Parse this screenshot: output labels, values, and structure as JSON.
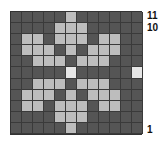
{
  "chart_data": {
    "type": "heatmap",
    "title": "",
    "columns": 12,
    "rows": 11,
    "colors": {
      "0": "#555555",
      "1": "#bdbdbd",
      "2": "#e6e6e6"
    },
    "grid_line_color": "#333333",
    "row_labels_visible": [
      {
        "row": 11,
        "label": "11"
      },
      {
        "row": 10,
        "label": "10"
      },
      {
        "row": 1,
        "label": "1"
      }
    ],
    "cells_top_to_bottom": [
      [
        0,
        0,
        0,
        0,
        0,
        1,
        0,
        0,
        0,
        0,
        0,
        0
      ],
      [
        0,
        0,
        0,
        0,
        1,
        1,
        1,
        0,
        0,
        0,
        0,
        0
      ],
      [
        0,
        1,
        1,
        0,
        1,
        1,
        1,
        0,
        1,
        1,
        0,
        0
      ],
      [
        0,
        1,
        1,
        1,
        0,
        1,
        0,
        1,
        1,
        1,
        0,
        0
      ],
      [
        0,
        0,
        1,
        1,
        1,
        0,
        1,
        1,
        1,
        0,
        0,
        0
      ],
      [
        0,
        0,
        0,
        0,
        0,
        2,
        0,
        0,
        0,
        0,
        0,
        2
      ],
      [
        0,
        0,
        1,
        1,
        1,
        0,
        1,
        1,
        1,
        0,
        0,
        0
      ],
      [
        0,
        1,
        1,
        1,
        0,
        1,
        0,
        1,
        1,
        1,
        0,
        0
      ],
      [
        0,
        1,
        1,
        0,
        1,
        1,
        1,
        0,
        1,
        1,
        0,
        0
      ],
      [
        0,
        0,
        0,
        0,
        1,
        1,
        1,
        0,
        0,
        0,
        0,
        0
      ],
      [
        0,
        0,
        0,
        0,
        0,
        1,
        0,
        0,
        0,
        0,
        0,
        0
      ]
    ]
  },
  "labels": {
    "row11": "11",
    "row10": "10",
    "row1": "1"
  }
}
